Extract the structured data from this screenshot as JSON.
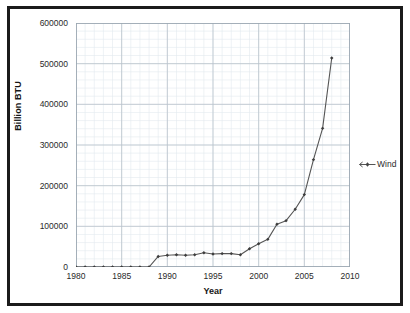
{
  "chart_data": {
    "type": "line",
    "title": "",
    "xlabel": "Year",
    "ylabel": "Billion BTU",
    "xlim": [
      1980,
      2010
    ],
    "ylim": [
      0,
      600000
    ],
    "ytick_step": 100000,
    "xtick_step": 5,
    "grid": true,
    "minor_grid": true,
    "legend_position": "right",
    "x_tick_labels": [
      "1980",
      "1985",
      "1990",
      "1995",
      "2000",
      "2005",
      "2010"
    ],
    "y_tick_labels": [
      "0",
      "100000",
      "200000",
      "300000",
      "400000",
      "500000",
      "600000"
    ],
    "series": [
      {
        "name": "Wind",
        "color": "#555555",
        "marker": "diamond",
        "x": [
          1980,
          1981,
          1982,
          1983,
          1984,
          1985,
          1986,
          1987,
          1988,
          1989,
          1990,
          1991,
          1992,
          1993,
          1994,
          1995,
          1996,
          1997,
          1998,
          1999,
          2000,
          2001,
          2002,
          2003,
          2004,
          2005,
          2006,
          2007,
          2008
        ],
        "values": [
          0,
          0,
          0,
          0,
          0,
          0,
          0,
          0,
          0,
          26000,
          29000,
          30000,
          29000,
          30000,
          35000,
          32000,
          33000,
          33000,
          30000,
          45000,
          57000,
          68000,
          105000,
          114000,
          142000,
          178000,
          264000,
          341000,
          514000
        ]
      }
    ]
  },
  "legend": {
    "entries": [
      {
        "label": "Wind"
      }
    ]
  },
  "axes": {
    "x_title": "Year",
    "y_title": "Billion BTU"
  }
}
